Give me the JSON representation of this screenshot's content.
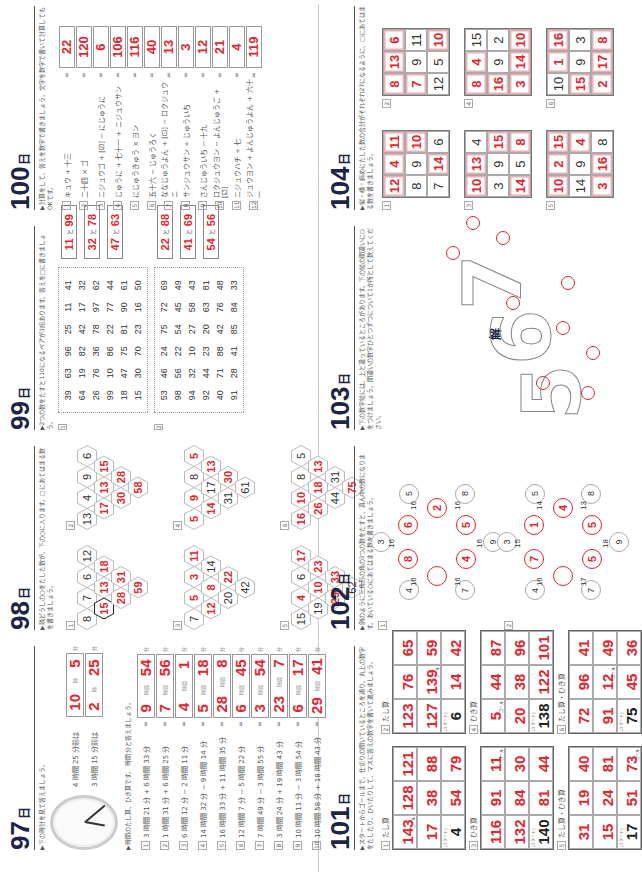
{
  "page_number": "140",
  "day_unit": "日",
  "sections": {
    "d97": {
      "num": "97",
      "part1_label": "問題",
      "part1_instr": "▶下の時計を見て答えましょう。",
      "clock_qs": [
        {
          "q": "4 時間 25 分前は",
          "h": "10",
          "m": "5"
        },
        {
          "q": "3 時間 15 分前は",
          "h": "2",
          "m": "25"
        }
      ],
      "part2_label": "計算",
      "part2_instr": "▶時間のたし算、ひき算です。 時間 分と答えましょう。",
      "unit_h": "時間",
      "unit_m": "分",
      "rows": [
        {
          "n": "1",
          "expr": "3 時間 21 分 + 6 時間 33 分",
          "h": "9",
          "m": "54"
        },
        {
          "n": "2",
          "expr": "1 時間 31 分 + 6 時間 25 分",
          "h": "7",
          "m": "56"
        },
        {
          "n": "3",
          "expr": "6 時間 12 分 − 2 時間 11 分",
          "h": "4",
          "m": "1"
        },
        {
          "n": "4",
          "expr": "14 時間 32 分 − 9 時間 14 分",
          "h": "5",
          "m": "18"
        },
        {
          "n": "5",
          "expr": "16 時間 33 分 + 11 時間 35 分",
          "h": "28",
          "m": "8"
        },
        {
          "n": "6",
          "expr": "12 時間 7 分 − 5 時間 22 分",
          "h": "6",
          "m": "45"
        },
        {
          "n": "7",
          "expr": "7 時間 49 分 − 3 時間 55 分",
          "h": "3",
          "m": "54"
        },
        {
          "n": "8",
          "expr": "3 時間 24 分 + 19 時間 43 分",
          "h": "23",
          "m": "7"
        },
        {
          "n": "9",
          "expr": "10 時間 11 分 − 3 時間 54 分",
          "h": "6",
          "m": "17"
        },
        {
          "n": "10",
          "expr": "10 時間 58 分 + 18 時間 43 分",
          "h": "29",
          "m": "41"
        }
      ]
    },
    "d98": {
      "num": "98",
      "instr": "▶隣どうしの○をたした数が、下の○に入ります。□にあてはまる数を書きましょう。",
      "puzzles": [
        {
          "n": "1",
          "rows": [
            [
              "8",
              "7",
              "6",
              "12"
            ],
            [
              "15",
              "13",
              "18"
            ],
            [
              "28",
              "31"
            ],
            [
              "59"
            ]
          ],
          "given": [
            [
              1,
              1,
              1,
              1
            ],
            [
              0,
              0,
              0
            ],
            [
              0,
              0
            ],
            [
              0
            ]
          ]
        },
        {
          "n": "2",
          "rows": [
            [
              "13",
              "4",
              "9",
              "6"
            ],
            [
              "17",
              "13",
              "15"
            ],
            [
              "30",
              "28"
            ],
            [
              "58"
            ]
          ],
          "given": [
            [
              1,
              1,
              1,
              1
            ],
            [
              0,
              0,
              0
            ],
            [
              0,
              0
            ],
            [
              0
            ]
          ]
        },
        {
          "n": "3",
          "rows": [
            [
              "7",
              "5",
              "3",
              "11"
            ],
            [
              "12",
              "8",
              "14"
            ],
            [
              "20",
              "22"
            ],
            [
              "42"
            ]
          ],
          "given": [
            [
              1,
              0,
              0,
              0
            ],
            [
              0,
              0,
              1
            ],
            [
              1,
              0
            ],
            [
              1
            ]
          ]
        },
        {
          "n": "4",
          "rows": [
            [
              "5",
              "9",
              "8",
              "5"
            ],
            [
              "14",
              "17",
              "13"
            ],
            [
              "31",
              "30"
            ],
            [
              "61"
            ]
          ],
          "given": [
            [
              0,
              0,
              1,
              0
            ],
            [
              0,
              1,
              0
            ],
            [
              1,
              0
            ],
            [
              1
            ]
          ]
        },
        {
          "n": "5",
          "rows": [
            [
              "15",
              "4",
              "6",
              "17"
            ],
            [
              "19",
              "10",
              "23"
            ],
            [
              "29",
              "33"
            ],
            [
              "62"
            ]
          ],
          "given": [
            [
              1,
              0,
              1,
              0
            ],
            [
              1,
              0,
              0
            ],
            [
              0,
              0
            ],
            [
              1
            ]
          ]
        },
        {
          "n": "6",
          "rows": [
            [
              "16",
              "10",
              "8",
              "5"
            ],
            [
              "26",
              "18",
              "13"
            ],
            [
              "44",
              "31"
            ],
            [
              "75"
            ]
          ],
          "given": [
            [
              0,
              0,
              1,
              1
            ],
            [
              0,
              0,
              0
            ],
            [
              1,
              1
            ],
            [
              0
            ]
          ]
        }
      ]
    },
    "d99": {
      "num": "99",
      "instr": "▶2つの数をたすと110になるペアが3組あります。答えを□に書きましょう。",
      "joiner": "と",
      "puzzles": [
        {
          "n": "1",
          "grid": [
            [
              "39",
              "63",
              "96",
              "25",
              "11",
              "41"
            ],
            [
              "64",
              "19",
              "82",
              "42",
              "17",
              "32"
            ],
            [
              "26",
              "76",
              "36",
              "78",
              "97",
              "62"
            ],
            [
              "99",
              "10",
              "86",
              "22",
              "77",
              "44"
            ],
            [
              "18",
              "47",
              "75",
              "81",
              "90",
              "61"
            ],
            [
              "15",
              "30",
              "70",
              "23",
              "16",
              "50"
            ]
          ],
          "answers": [
            [
              "11",
              "99"
            ],
            [
              "32",
              "78"
            ],
            [
              "47",
              "63"
            ]
          ]
        },
        {
          "n": "2",
          "grid": [
            [
              "53",
              "46",
              "24",
              "75",
              "72",
              "69"
            ],
            [
              "98",
              "56",
              "22",
              "54",
              "45",
              "49"
            ],
            [
              "94",
              "32",
              "10",
              "27",
              "58",
              "43"
            ],
            [
              "92",
              "44",
              "23",
              "20",
              "63",
              "81"
            ],
            [
              "40",
              "71",
              "88",
              "42",
              "76",
              "48"
            ],
            [
              "91",
              "28",
              "41",
              "85",
              "84",
              "33"
            ]
          ],
          "answers": [
            [
              "22",
              "88"
            ],
            [
              "41",
              "69"
            ],
            [
              "54",
              "56"
            ]
          ]
        }
      ]
    },
    "d100": {
      "num": "100",
      "instr": "▶計算をして、答えを数字で書きましょう。文字を数字で書いて計算してもOKです。",
      "rows": [
        {
          "n": "1",
          "expr": "キュウ + 十三",
          "a": "22"
        },
        {
          "n": "2",
          "expr": "二十四 × ゴ",
          "a": "120"
        },
        {
          "n": "3",
          "expr": "ニジュウゴ + [⚂] − にじゅうに",
          "a": "6"
        },
        {
          "n": "4",
          "expr": "じゅうに + 七十一 + ニジュウサン",
          "a": "106"
        },
        {
          "n": "5",
          "expr": "にじゅうきゅう × ヨン",
          "a": "116"
        },
        {
          "n": "6",
          "expr": "五十六 − じゅうろく",
          "a": "40"
        },
        {
          "n": "7",
          "expr": "ななじゅうよん + [⚀] − ロクジュウニ",
          "a": "13"
        },
        {
          "n": "8",
          "expr": "サンジュウサン ÷ じゅういち",
          "a": "3"
        },
        {
          "n": "9",
          "expr": "さんじゅういち − 十九",
          "a": "12"
        },
        {
          "n": "10",
          "expr": "ロクジュウヨン − よんじゅうご + [⚁]",
          "a": "21"
        },
        {
          "n": "11",
          "expr": "ニジュウハチ ÷ 七",
          "a": "4"
        },
        {
          "n": "12",
          "expr": "ジュウヨン + よんじゅうよん + 六十一",
          "a": "119"
        }
      ]
    },
    "d101": {
      "num": "101",
      "instr": "▶スタートからゴールまで、仕切りの開いているところを通り、丸上の数字をたしたり、ひいたりして、マスに答えの数字を書いて進みましょう。",
      "start_label": "スタート",
      "goal_label": "ゴール",
      "puzzles": [
        {
          "n": "1",
          "title": "たし算",
          "cells": [
            [
              "143",
              "128",
              "121"
            ],
            [
              "17",
              "38",
              "88"
            ],
            [
              "4",
              "54",
              "79"
            ]
          ],
          "start": [
            2,
            0
          ],
          "goal": [
            0,
            0
          ]
        },
        {
          "n": "2",
          "title": "たし算",
          "cells": [
            [
              "123",
              "76",
              "65"
            ],
            [
              "127",
              "139",
              "59"
            ],
            [
              "6",
              "14",
              "42"
            ]
          ],
          "start": [
            2,
            0
          ],
          "goal": [
            1,
            1
          ]
        },
        {
          "n": "3",
          "title": "ひき算",
          "cells": [
            [
              "116",
              "91",
              "11"
            ],
            [
              "132",
              "84",
              "30"
            ],
            [
              "140",
              "81",
              "44"
            ]
          ],
          "start": [
            2,
            0
          ],
          "goal": [
            0,
            2
          ]
        },
        {
          "n": "4",
          "title": "ひき算",
          "cells": [
            [
              "5",
              "44",
              "87"
            ],
            [
              "20",
              "38",
              "96"
            ],
            [
              "138",
              "122",
              "101"
            ]
          ],
          "start": [
            2,
            0
          ],
          "goal": [
            0,
            0
          ]
        },
        {
          "n": "5",
          "title": "たし算・ひき算",
          "cells": [
            [
              "31",
              "19",
              "40"
            ],
            [
              "15",
              "24",
              "81"
            ],
            [
              "17",
              "51",
              "73"
            ]
          ],
          "start": [
            2,
            0
          ],
          "goal": [
            2,
            2
          ]
        },
        {
          "n": "6",
          "title": "たし算・ひき算",
          "cells": [
            [
              "72",
              "96",
              "41"
            ],
            [
              "91",
              "12",
              "49"
            ],
            [
              "75",
              "45",
              "36"
            ]
          ],
          "start": [
            2,
            0
          ],
          "goal": [
            1,
            1
          ]
        }
      ]
    },
    "d102": {
      "num": "102",
      "instr": "▶例のように三角形の角の3つの数をたすと、真ん中の数になります。あいている○にあてはまる数を書きましょう。",
      "puzzles": [
        {
          "n": "1",
          "center": "",
          "inner": [
            "8",
            "6",
            "2",
            "5",
            "4"
          ],
          "outer": [
            "3",
            "5",
            "5",
            "8",
            "9",
            "7",
            "4"
          ],
          "sums": [
            "16",
            "16",
            "16",
            "16",
            "16",
            "16"
          ]
        },
        {
          "n": "2",
          "center": "",
          "inner": [
            "7",
            "1",
            "4",
            "5",
            "5"
          ],
          "outer": [
            "3",
            "5",
            "8",
            "8",
            "9",
            "7",
            "4"
          ],
          "sums": [
            "15",
            "14",
            "13",
            "18",
            "17",
            "16"
          ]
        }
      ]
    },
    "d103": {
      "num": "103",
      "instr": "▶下の数字絵には、上と違っているところがあります。下の絵の間違いに○をつけましょう。間違いの数字ひとつずつについて1か所として数えてください。",
      "answer_label": "解",
      "digits": [
        "5",
        "6",
        "7"
      ]
    },
    "d104": {
      "num": "104",
      "instr": "▶縦・横・斜めにたした数の合計がそれぞれ27になるように、□にあてはまる数を書きましょう。",
      "squares": [
        {
          "n": "1",
          "cells": [
            [
              "12",
              "4",
              "11"
            ],
            [
              "8",
              "9",
              "10"
            ],
            [
              "7",
              "14",
              "6"
            ]
          ],
          "red": [
            [
              1,
              1,
              1
            ],
            [
              0,
              0,
              1
            ],
            [
              0,
              1,
              0
            ]
          ]
        },
        {
          "n": "2",
          "cells": [
            [
              "8",
              "13",
              "6"
            ],
            [
              "7",
              "9",
              "11"
            ],
            [
              "12",
              "5",
              "10"
            ]
          ],
          "red": [
            [
              1,
              1,
              1
            ],
            [
              1,
              0,
              0
            ],
            [
              0,
              0,
              1
            ]
          ]
        },
        {
          "n": "3",
          "cells": [
            [
              "10",
              "13",
              "4"
            ],
            [
              "3",
              "9",
              "15"
            ],
            [
              "14",
              "5",
              "8"
            ]
          ],
          "red": [
            [
              1,
              1,
              0
            ],
            [
              0,
              0,
              1
            ],
            [
              1,
              0,
              1
            ]
          ]
        },
        {
          "n": "4",
          "cells": [
            [
              "8",
              "4",
              "15"
            ],
            [
              "16",
              "9",
              "2"
            ],
            [
              "3",
              "14",
              "10"
            ]
          ],
          "red": [
            [
              1,
              1,
              0
            ],
            [
              1,
              0,
              0
            ],
            [
              1,
              1,
              1
            ]
          ]
        },
        {
          "n": "5",
          "cells": [
            [
              "10",
              "2",
              "15"
            ],
            [
              "14",
              "9",
              "4"
            ],
            [
              "3",
              "16",
              "8"
            ]
          ],
          "red": [
            [
              1,
              1,
              1
            ],
            [
              0,
              0,
              1
            ],
            [
              1,
              1,
              0
            ]
          ]
        },
        {
          "n": "6",
          "cells": [
            [
              "10",
              "1",
              "16"
            ],
            [
              "15",
              "9",
              "3"
            ],
            [
              "2",
              "17",
              "8"
            ]
          ],
          "red": [
            [
              0,
              1,
              1
            ],
            [
              1,
              0,
              0
            ],
            [
              1,
              1,
              1
            ]
          ]
        }
      ]
    }
  },
  "colors": {
    "accent_red": "#e0262f",
    "heading_navy": "#1d2445"
  }
}
